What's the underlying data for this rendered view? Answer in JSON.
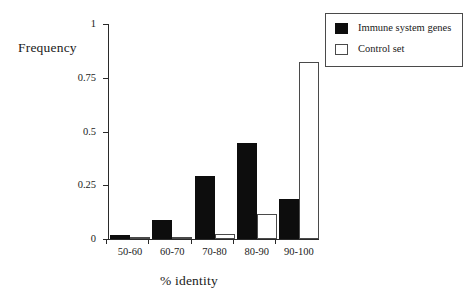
{
  "chart_data": {
    "type": "bar",
    "title": "",
    "subtitle": "",
    "xlabel": "% identity",
    "ylabel": "Frequency",
    "categories": [
      "50-60",
      "60-70",
      "70-80",
      "80-90",
      "90-100"
    ],
    "series": [
      {
        "name": "Immune system genes",
        "color": "#0d0d0d",
        "values": [
          0.02,
          0.09,
          0.295,
          0.445,
          0.185
        ]
      },
      {
        "name": "Control set",
        "color": "#ffffff",
        "values": [
          0.005,
          0.007,
          0.025,
          0.115,
          0.825
        ]
      }
    ],
    "ylim": [
      0,
      1
    ],
    "yticks": [
      0,
      0.25,
      0.5,
      0.75,
      1
    ],
    "ytick_labels": [
      "0",
      "0.25",
      "0.5",
      "0.75",
      "1"
    ],
    "grid": false,
    "legend_position": "top-right",
    "legend_entries": [
      "Immune system genes",
      "Control set"
    ]
  },
  "legend": {
    "entries": [
      {
        "label": "Immune system genes",
        "swatch": "filled-black"
      },
      {
        "label": "Control set",
        "swatch": "outline-white"
      }
    ]
  }
}
